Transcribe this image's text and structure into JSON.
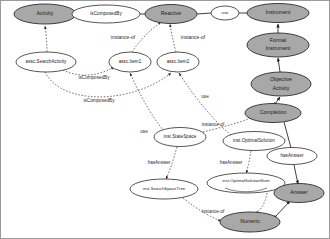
{
  "diagram": {
    "colors": {
      "class_node_fill": "#a8a8a8",
      "instance_node_fill": "#ffffff",
      "stroke": "#2b2b2b",
      "background": "#ffffff",
      "border": "#9a9a9a"
    },
    "nodes": [
      {
        "id": "activity",
        "label": "Activity",
        "kind": "class",
        "fill": "#a8a8a8",
        "cx": 44,
        "cy": 13,
        "rx": 31,
        "ry": 10
      },
      {
        "id": "isComposedBy_top",
        "label": "isComposedBy",
        "kind": "relation",
        "fill": "#ffffff",
        "cx": 105,
        "cy": 13,
        "rx": 34,
        "ry": 9
      },
      {
        "id": "reactive",
        "label": "Reactive",
        "kind": "class",
        "fill": "#a8a8a8",
        "cx": 170,
        "cy": 13,
        "rx": 26,
        "ry": 9.5
      },
      {
        "id": "use_top",
        "label": "use",
        "kind": "relation",
        "fill": "#ffffff",
        "cx": 224,
        "cy": 12,
        "rx": 14,
        "ry": 7
      },
      {
        "id": "instrument",
        "label": "Instrument",
        "kind": "class",
        "fill": "#a8a8a8",
        "cx": 277,
        "cy": 12,
        "rx": 31,
        "ry": 9.5
      },
      {
        "id": "formalInstrument",
        "label": "Formal Instrument",
        "kind": "class",
        "fill": "#a8a8a8",
        "cx": 277,
        "cy": 44,
        "rx": 31,
        "ry": 12
      },
      {
        "id": "objectiveActivity",
        "label": "Objective Activity",
        "kind": "class",
        "fill": "#a8a8a8",
        "cx": 280,
        "cy": 83,
        "rx": 30,
        "ry": 12
      },
      {
        "id": "completion",
        "label": "Completion",
        "kind": "class",
        "fill": "#a8a8a8",
        "cx": 272,
        "cy": 112,
        "rx": 28,
        "ry": 9.5
      },
      {
        "id": "asscSearchActivity",
        "label": "assc.SearchActivity",
        "kind": "instance",
        "fill": "#ffffff",
        "cx": 45,
        "cy": 61,
        "rx": 30,
        "ry": 10
      },
      {
        "id": "asscItem1",
        "label": "assc.Item1",
        "kind": "instance",
        "fill": "#ffffff",
        "cx": 129,
        "cy": 61,
        "rx": 21,
        "ry": 10
      },
      {
        "id": "asscItem2",
        "label": "assc.Item2",
        "kind": "instance",
        "fill": "#ffffff",
        "cx": 177,
        "cy": 61,
        "rx": 21,
        "ry": 10
      },
      {
        "id": "instStateSpace",
        "label": "inst.StateSpace",
        "kind": "instance",
        "fill": "#ffffff",
        "cx": 179,
        "cy": 136,
        "rx": 26,
        "ry": 9.5
      },
      {
        "id": "instOptimalSolution",
        "label": "inst.OptimalSolution",
        "kind": "instance",
        "fill": "#ffffff",
        "cx": 253,
        "cy": 140,
        "rx": 31,
        "ry": 9.5
      },
      {
        "id": "hasAnswer_node",
        "label": "hasAnswer",
        "kind": "relation",
        "fill": "#ffffff",
        "cx": 291,
        "cy": 155,
        "rx": 25,
        "ry": 8.5
      },
      {
        "id": "instSearchSpaceTree",
        "label": "inst.SearchSpaceTree",
        "kind": "instance",
        "fill": "#ffffff",
        "cx": 163,
        "cy": 188,
        "rx": 34,
        "ry": 10
      },
      {
        "id": "instOptSolutionNum",
        "label": "inst.OptimalSolutionNum",
        "kind": "instance",
        "fill": "#ffffff",
        "cx": 245,
        "cy": 182,
        "rx": 39,
        "ry": 10
      },
      {
        "id": "answer",
        "label": "Answer",
        "kind": "class",
        "fill": "#a8a8a8",
        "cx": 298,
        "cy": 192,
        "rx": 25,
        "ry": 9.5
      },
      {
        "id": "numeric",
        "label": "Numeric",
        "kind": "class",
        "fill": "#a8a8a8",
        "cx": 249,
        "cy": 221,
        "rx": 30,
        "ry": 10
      }
    ],
    "edge_labels": [
      {
        "id": "instance_of_1",
        "text": "instance-of",
        "x": 122,
        "y": 37
      },
      {
        "id": "instance_of_2",
        "text": "instance-of",
        "x": 192,
        "y": 37
      },
      {
        "id": "isComposedBy_1",
        "text": "isComposedBy",
        "x": 93,
        "y": 77
      },
      {
        "id": "isComposedBy_2",
        "text": "isComposedBy",
        "x": 98,
        "y": 100
      },
      {
        "id": "use_1",
        "text": "use",
        "x": 204,
        "y": 96
      },
      {
        "id": "use_2",
        "text": "use",
        "x": 143,
        "y": 131
      },
      {
        "id": "instance_of_3",
        "text": "instance-of",
        "x": 212,
        "y": 124
      },
      {
        "id": "hasAnswer_1",
        "text": "hasAnswer",
        "x": 158,
        "y": 162
      },
      {
        "id": "hasAnswer_2",
        "text": "hasAnswer",
        "x": 230,
        "y": 162
      },
      {
        "id": "instance_of_4",
        "text": "instance-of",
        "x": 212,
        "y": 211
      }
    ],
    "edges": [
      {
        "id": "e-activity-isComposedBy",
        "style": "solid",
        "from": "activity",
        "to": "isComposedBy_top"
      },
      {
        "id": "e-isComposedBy-reactive",
        "style": "solid",
        "from": "isComposedBy_top",
        "to": "reactive"
      },
      {
        "id": "e-reactive-use",
        "style": "solid",
        "from": "reactive",
        "to": "use_top"
      },
      {
        "id": "e-use-instrument",
        "style": "solid",
        "from": "use_top",
        "to": "instrument"
      },
      {
        "id": "e-formal-instrument",
        "style": "solid",
        "from": "formalInstrument",
        "to": "instrument"
      },
      {
        "id": "e-objective-formal",
        "style": "solid",
        "from": "objectiveActivity",
        "to": "formalInstrument"
      },
      {
        "id": "e-completion-objective",
        "style": "solid",
        "from": "completion",
        "to": "objectiveActivity"
      },
      {
        "id": "e-search-activity-isa",
        "style": "dashed",
        "from": "asscSearchActivity",
        "to": "activity"
      },
      {
        "id": "e-item1-reactive",
        "style": "dashed",
        "from": "asscItem1",
        "to": "reactive"
      },
      {
        "id": "e-item2-reactive",
        "style": "dashed",
        "from": "asscItem2",
        "to": "reactive"
      },
      {
        "id": "e-search-item1",
        "style": "dashed",
        "from": "asscSearchActivity",
        "to": "asscItem1"
      },
      {
        "id": "e-search-item2",
        "style": "dashed",
        "from": "asscSearchActivity",
        "to": "asscItem2"
      },
      {
        "id": "e-statespace-item1",
        "style": "dashed",
        "from": "instStateSpace",
        "to": "asscItem1"
      },
      {
        "id": "e-optimal-item2",
        "style": "dashed",
        "from": "instOptimalSolution",
        "to": "asscItem2"
      },
      {
        "id": "e-statespace-completion",
        "style": "dashed",
        "from": "instStateSpace",
        "to": "completion"
      },
      {
        "id": "e-statespace-tree",
        "style": "dashed",
        "from": "instStateSpace",
        "to": "instSearchSpaceTree"
      },
      {
        "id": "e-optimal-num",
        "style": "dashed",
        "from": "instOptimalSolution",
        "to": "instOptSolutionNum"
      },
      {
        "id": "e-completion-hasAnswer",
        "style": "solid",
        "from": "completion",
        "to": "hasAnswer_node"
      },
      {
        "id": "e-hasAnswer-answer",
        "style": "solid",
        "from": "hasAnswer_node",
        "to": "answer"
      },
      {
        "id": "e-tree-numeric",
        "style": "dashed",
        "from": "instSearchSpaceTree",
        "to": "numeric"
      },
      {
        "id": "e-num-numeric",
        "style": "dashed",
        "from": "instOptSolutionNum",
        "to": "numeric"
      },
      {
        "id": "e-numeric-answer",
        "style": "solid",
        "from": "numeric",
        "to": "answer"
      }
    ]
  }
}
